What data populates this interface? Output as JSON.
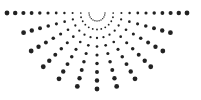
{
  "graphic": {
    "name": "dotted-half-sunburst",
    "background": "#ffffff",
    "dot_color": "#222222",
    "center": [
      97,
      13
    ],
    "ray_count": 13,
    "ray_angle_start_deg": 0,
    "ray_angle_step_deg": 15,
    "dots_per_ray": 9,
    "radius_inner": 8,
    "radius_step": 8.5,
    "dot_size_min": 0.7,
    "dot_size_max": 2.4,
    "horizontal_ray_dots": 11,
    "horizontal_ray_step": 8.2
  }
}
